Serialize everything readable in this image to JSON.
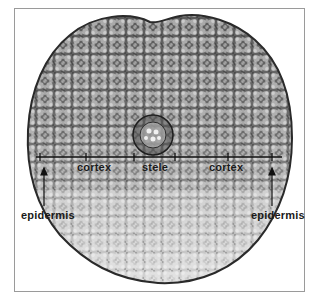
{
  "figure": {
    "labels": {
      "cortex_left": "cortex",
      "stele": "stele",
      "cortex_right": "cortex",
      "epidermis_left": "epidermis",
      "epidermis_right": "epidermis"
    },
    "colors": {
      "frame_border": "#9a9a9a",
      "background": "#ffffff",
      "label_text": "#1a1a1a",
      "tissue_dark": "#3a3a3a",
      "tissue_light": "#d8d8d8"
    }
  }
}
